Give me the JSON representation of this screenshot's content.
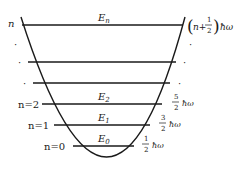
{
  "diagram": {
    "stroke_color": "#1a1a1a",
    "background": "#ffffff",
    "well": {
      "shape": "parabola",
      "top_left": [
        21,
        17
      ],
      "top_right": [
        185,
        17
      ],
      "vertex": [
        110,
        157
      ]
    },
    "levels": [
      {
        "id": "n",
        "y": 25,
        "quantum_label": "n",
        "energy_symbol": "E",
        "energy_subscript": "n",
        "energy_value": "(n+1/2)ħω",
        "frac_num": "1",
        "frac_den": "2",
        "prefix": "n+",
        "hbar_omega": "ħω"
      },
      {
        "id": "dots-1",
        "y": 62
      },
      {
        "id": "dots-2",
        "y": 83
      },
      {
        "id": "2",
        "y": 104,
        "quantum_label": "n=2",
        "energy_symbol": "E",
        "energy_subscript": "2",
        "energy_value": "5/2 ħω",
        "frac_num": "5",
        "frac_den": "2",
        "hbar_omega": "ħω"
      },
      {
        "id": "1",
        "y": 125,
        "quantum_label": "n=1",
        "energy_symbol": "E",
        "energy_subscript": "1",
        "energy_value": "3/2 ħω",
        "frac_num": "3",
        "frac_den": "2",
        "hbar_omega": "ħω"
      },
      {
        "id": "0",
        "y": 146,
        "quantum_label": "n=0",
        "energy_symbol": "E",
        "energy_subscript": "0",
        "energy_value": "1/2 ħω",
        "frac_num": "1",
        "frac_den": "2",
        "hbar_omega": "ħω"
      }
    ],
    "ellipsis_dots": "·"
  }
}
